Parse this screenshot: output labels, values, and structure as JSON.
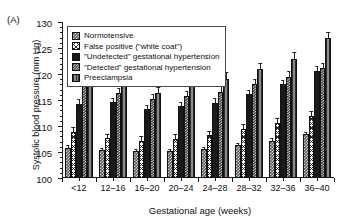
{
  "panel": {
    "label": "(A)"
  },
  "legend": {
    "position": "top-left-inside",
    "entries": [
      {
        "key": "normotensive",
        "label": "Normotensive",
        "swatch": "checker-dark"
      },
      {
        "key": "falsepositive",
        "label": "False positive (\"white coat\")",
        "swatch": "cross-hatch"
      },
      {
        "key": "undetected",
        "label": "\"Undetected\" gestational hypertension",
        "swatch": "solid-black"
      },
      {
        "key": "detected",
        "label": "\"Detected\" gestational hypertension",
        "swatch": "checker-fine"
      },
      {
        "key": "preeclampsia",
        "label": "Preeclampsia",
        "swatch": "vertical-stripes"
      }
    ]
  },
  "chart_data": {
    "type": "bar",
    "title": "",
    "xlabel": "Gestational age (weeks)",
    "ylabel": "Systolic blood pressure (mm Hg)",
    "ylim": [
      100,
      130
    ],
    "yticks": [
      100,
      105,
      110,
      115,
      120,
      125,
      130
    ],
    "ytick_labels": [
      "100",
      "105",
      "110",
      "115",
      "120",
      "125",
      "130"
    ],
    "grid": false,
    "categories": [
      "<12",
      "12–16",
      "16–20",
      "20–24",
      "24–28",
      "28–32",
      "32–36",
      "36–40"
    ],
    "series": [
      {
        "name": "Normotensive",
        "values": [
          105.8,
          105.3,
          105.1,
          105.2,
          105.6,
          106.3,
          107.2,
          108.4
        ],
        "errors": [
          0.5,
          0.4,
          0.4,
          0.4,
          0.4,
          0.4,
          0.4,
          0.4
        ]
      },
      {
        "name": "False positive (\"white coat\")",
        "values": [
          108.9,
          107.6,
          107.2,
          107.5,
          108.2,
          109.4,
          110.6,
          112.0
        ],
        "errors": [
          0.9,
          0.9,
          0.9,
          0.9,
          0.9,
          0.9,
          0.9,
          0.9
        ]
      },
      {
        "name": "\"Undetected\" gestational hypertension",
        "values": [
          114.3,
          114.6,
          113.3,
          113.8,
          114.4,
          116.1,
          118.0,
          120.6
        ],
        "errors": [
          0.8,
          0.8,
          0.8,
          0.9,
          0.9,
          0.9,
          0.9,
          0.9
        ]
      },
      {
        "name": "\"Detected\" gestational hypertension",
        "values": [
          117.8,
          116.4,
          115.2,
          115.8,
          116.6,
          118.1,
          119.5,
          121.2
        ],
        "errors": [
          1.0,
          1.0,
          1.0,
          1.0,
          1.0,
          1.0,
          1.0,
          1.0
        ]
      },
      {
        "name": "Preeclampsia",
        "values": [
          118.6,
          118.2,
          116.3,
          117.8,
          119.1,
          120.9,
          122.9,
          126.9
        ],
        "errors": [
          1.7,
          1.3,
          1.2,
          1.3,
          1.3,
          1.3,
          1.3,
          1.1
        ]
      }
    ]
  }
}
